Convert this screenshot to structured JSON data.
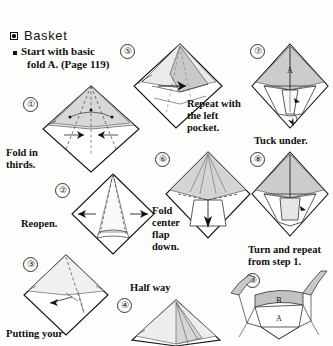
{
  "page": {
    "title": "Basket",
    "title_bullet_icon": "filled-square-bullet-icon",
    "intro_bullet_icon": "small-square-bullet-icon",
    "intro_line1": "Start with basic",
    "intro_line2": "fold A. (Page 119)",
    "paper_color": "#fdfdfb",
    "ink_color": "#111111",
    "shade_color": "#c9c9c9",
    "shade_light": "#e2e2e2"
  },
  "steps": [
    {
      "number": "①",
      "caption_line1": "Fold in",
      "caption_line2": "thirds.",
      "caption": "Fold in thirds."
    },
    {
      "number": "②",
      "caption_line1": "Reopen.",
      "caption_line2": "",
      "caption": "Reopen."
    },
    {
      "number": "③",
      "caption_line1": "Putting your",
      "caption_line2": "",
      "caption": "Putting your"
    },
    {
      "number": "④",
      "caption_line1": "Half way",
      "caption_line2": "",
      "caption": "Half way"
    },
    {
      "number": "⑤",
      "caption_line1": "Repeat with",
      "caption_line2": "the left",
      "caption_line3": "pocket.",
      "caption": "Repeat with the left pocket."
    },
    {
      "number": "⑥",
      "caption_line1": "Fold",
      "caption_line2": "center",
      "caption_line3": "flap",
      "caption_line4": "down.",
      "caption": "Fold center flap down."
    },
    {
      "number": "⑦",
      "caption_line1": "Tuck under.",
      "caption_line2": "",
      "caption": "Tuck under.",
      "figure_label": "A"
    },
    {
      "number": "⑧",
      "caption_line1": "Turn and repeat",
      "caption_line2": "from step 1.",
      "caption": "Turn and repeat from step 1."
    },
    {
      "number": "⑨",
      "caption_line1": "",
      "caption_line2": "",
      "caption": "",
      "figure_label_a": "A",
      "figure_label_b": "B"
    }
  ]
}
